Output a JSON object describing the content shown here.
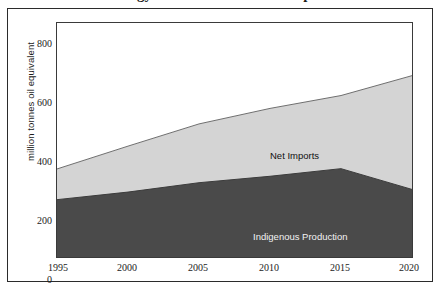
{
  "figure": {
    "title_cropped": "Energy Production and Net Imports",
    "background_color": "#ffffff",
    "frame_color": "#2b2b2b"
  },
  "chart_data": {
    "type": "area",
    "stacked": true,
    "title": "",
    "xlabel": "",
    "ylabel": "million tonnes oil equivalent",
    "x": [
      1995,
      2000,
      2005,
      2010,
      2015,
      2020
    ],
    "xtick_labels": [
      "1995",
      "2000",
      "2005",
      "2010",
      "2015",
      "2020"
    ],
    "xlim": [
      1995,
      2020
    ],
    "ylim": [
      0,
      800
    ],
    "ytick_labels": [
      "0",
      "200",
      "400",
      "600",
      "800"
    ],
    "yticks": [
      0,
      200,
      400,
      600,
      800
    ],
    "grid": false,
    "legend": "in-plot annotations",
    "series": [
      {
        "name": "Indigenous Production",
        "color": "#4a4a4a",
        "label_color": "#f2f2f2",
        "values": [
          196,
          222,
          254,
          276,
          302,
          231
        ]
      },
      {
        "name": "Net Imports",
        "color": "#d4d4d4",
        "label_color": "#111111",
        "values": [
          105,
          157,
          201,
          232,
          250,
          389
        ]
      }
    ],
    "totals": [
      301,
      379,
      455,
      508,
      552,
      620
    ],
    "annotations": [
      {
        "text": "Net Imports",
        "series": "Net Imports"
      },
      {
        "text": "Indigenous Production",
        "series": "Indigenous Production"
      }
    ]
  }
}
